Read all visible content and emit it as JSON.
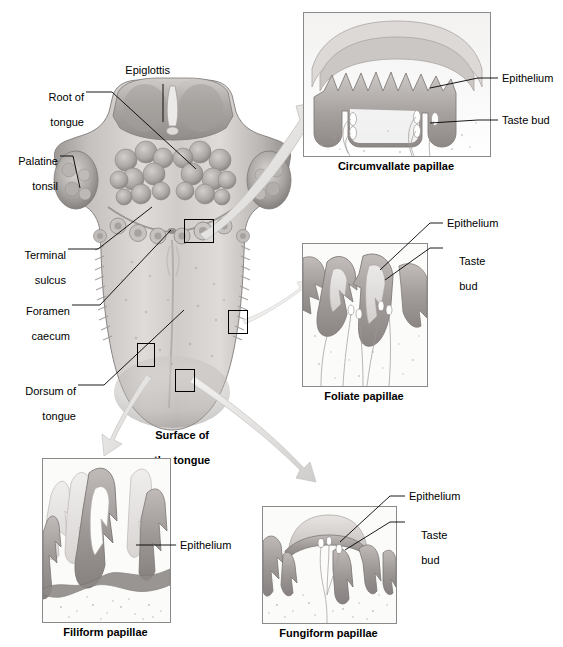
{
  "figure": {
    "type": "anatomical-diagram"
  },
  "colors": {
    "tissue_light": "#e8e6e4",
    "tissue_mid": "#bdb9b6",
    "tissue_dark": "#8e8a88",
    "epithelium": "#9a9593",
    "arrow": "#e4e3e1",
    "arrow_stroke": "#b9b7b5",
    "panel_border": "#8a8a8a",
    "leader": "#000000",
    "text": "#000000"
  },
  "main_diagram": {
    "center_caption": [
      "Surface of",
      "the tongue"
    ],
    "labels": [
      {
        "id": "epiglottis",
        "text": "Epiglottis",
        "lines": [
          "Epiglottis"
        ]
      },
      {
        "id": "root-of-tongue",
        "text": "Root of tongue",
        "lines": [
          "Root of",
          "tongue"
        ]
      },
      {
        "id": "palatine-tonsil",
        "text": "Palatine tonsil",
        "lines": [
          "Palatine",
          "tonsil"
        ]
      },
      {
        "id": "terminal-sulcus",
        "text": "Terminal sulcus",
        "lines": [
          "Terminal",
          "sulcus"
        ]
      },
      {
        "id": "foramen-caecum",
        "text": "Foramen caecum",
        "lines": [
          "Foramen",
          "caecum"
        ]
      },
      {
        "id": "dorsum-of-tongue",
        "text": "Dorsum of tongue",
        "lines": [
          "Dorsum of",
          "tongue"
        ]
      }
    ],
    "highlight_boxes": [
      {
        "id": "box-circumvallate",
        "points_to": "Circumvallate papillae"
      },
      {
        "id": "box-foliate",
        "points_to": "Foliate papillae"
      },
      {
        "id": "box-filiform",
        "points_to": "Filiform papillae"
      },
      {
        "id": "box-fungiform",
        "points_to": "Fungiform papillae"
      }
    ]
  },
  "panels": [
    {
      "id": "circumvallate",
      "caption": "Circumvallate papillae",
      "callouts": [
        {
          "id": "epithelium",
          "lines": [
            "Epithelium"
          ]
        },
        {
          "id": "taste-bud",
          "lines": [
            "Taste bud"
          ]
        }
      ]
    },
    {
      "id": "foliate",
      "caption": "Foliate papillae",
      "callouts": [
        {
          "id": "epithelium",
          "lines": [
            "Epithelium"
          ]
        },
        {
          "id": "taste-bud",
          "lines": [
            "Taste",
            "bud"
          ]
        }
      ]
    },
    {
      "id": "filiform",
      "caption": "Filiform papillae",
      "callouts": [
        {
          "id": "epithelium",
          "lines": [
            "Epithelium"
          ]
        }
      ]
    },
    {
      "id": "fungiform",
      "caption": "Fungiform papillae",
      "callouts": [
        {
          "id": "epithelium",
          "lines": [
            "Epithelium"
          ]
        },
        {
          "id": "taste-bud",
          "lines": [
            "Taste",
            "bud"
          ]
        }
      ]
    }
  ]
}
